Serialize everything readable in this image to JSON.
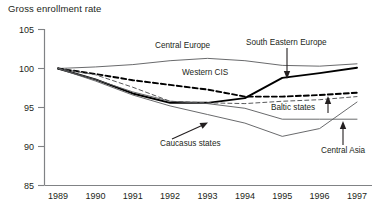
{
  "chart_data": {
    "type": "line",
    "title": "Gross enrollment rate",
    "xlabel": "",
    "ylabel": "",
    "ylim": [
      85,
      105
    ],
    "yticks": [
      85,
      90,
      95,
      100,
      105
    ],
    "grid": false,
    "legend_position": "inline-annotations",
    "x": [
      1989,
      1990,
      1991,
      1992,
      1993,
      1994,
      1995,
      1996,
      1997
    ],
    "xticklabels": [
      "1989",
      "1990",
      "1991",
      "1992",
      "1993",
      "1994",
      "1995",
      "1996",
      "1997"
    ],
    "series": [
      {
        "name": "Central Europe",
        "style": "solid-thin",
        "color": "#58595b",
        "values": [
          100.0,
          100.2,
          100.5,
          101.0,
          101.3,
          101.0,
          100.4,
          100.3,
          100.6
        ]
      },
      {
        "name": "South Eastern Europe",
        "style": "solid-thick",
        "color": "#000000",
        "values": [
          100.0,
          98.6,
          96.8,
          95.6,
          95.6,
          96.2,
          98.8,
          99.4,
          100.1
        ]
      },
      {
        "name": "Western CIS",
        "style": "dashed-thick",
        "color": "#000000",
        "values": [
          100.0,
          99.3,
          98.5,
          97.9,
          97.3,
          96.4,
          96.4,
          96.6,
          96.9
        ]
      },
      {
        "name": "Baltic states",
        "style": "dashed-thin",
        "color": "#58595b",
        "values": [
          100.0,
          99.2,
          97.6,
          95.8,
          95.6,
          95.5,
          95.8,
          96.0,
          96.4
        ]
      },
      {
        "name": "Caucasus states",
        "style": "solid-thin",
        "color": "#58595b",
        "values": [
          100.0,
          98.4,
          96.6,
          95.2,
          94.1,
          93.0,
          91.3,
          92.3,
          95.7
        ]
      },
      {
        "name": "Central Asia",
        "style": "solid-thin",
        "color": "#58595b",
        "values": [
          100.0,
          98.6,
          97.0,
          95.8,
          95.5,
          94.9,
          93.5,
          93.5,
          93.5
        ]
      }
    ],
    "annotations": [
      {
        "text": "Central Europe",
        "target": "Central Europe",
        "arrow": false
      },
      {
        "text": "South Eastern Europe",
        "target": "South Eastern Europe",
        "arrow": true
      },
      {
        "text": "Western CIS",
        "target": "Western CIS",
        "arrow": false
      },
      {
        "text": "Baltic states",
        "target": "Baltic states",
        "arrow": true
      },
      {
        "text": "Caucasus states",
        "target": "Caucasus states",
        "arrow": true
      },
      {
        "text": "Central Asia",
        "target": "Central Asia",
        "arrow": true
      }
    ]
  }
}
